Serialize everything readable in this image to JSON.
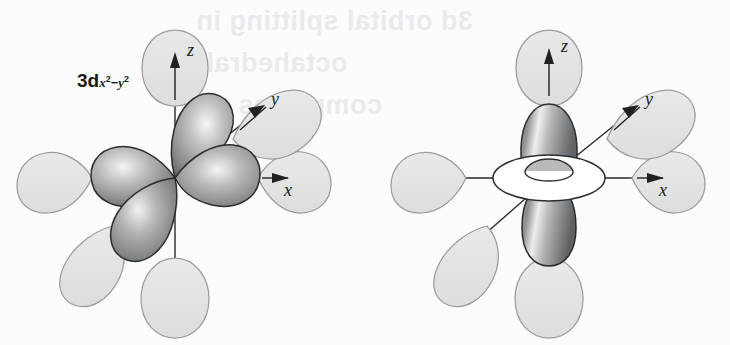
{
  "figure": {
    "kind": "orbital-diagram",
    "background_color": "#fcfcfc",
    "ink_color": "#1b1b1b",
    "ligand_lobe_fill": "#e3e4e3",
    "ligand_lobe_stroke": "#9a9c9a",
    "orbital_lobe_fill_light": "#f0f0f0",
    "orbital_lobe_fill_mid": "#8d8f8e",
    "orbital_lobe_fill_dark": "#55585a",
    "orbital_lobe_stroke": "#2b2d2e",
    "torus_fill": "#ffffff",
    "torus_stroke": "#2b2d2e"
  },
  "panels": [
    {
      "id": "dx2y2",
      "label": {
        "base": "3d",
        "sub_x": "x",
        "sub_x_exp": "2",
        "sub_minus": "−",
        "sub_y": "y",
        "sub_y_exp": "2",
        "full_text": "3d x2-y2"
      },
      "orbital_type": "d(x²−y²)",
      "orbital_lobe_count": 4,
      "orbital_lobe_directions": [
        "+x",
        "−x",
        "+y",
        "−y"
      ],
      "has_torus": false,
      "axes": [
        {
          "name": "z",
          "letter": "z",
          "direction": "up"
        },
        {
          "name": "x",
          "letter": "x",
          "direction": "right"
        },
        {
          "name": "y",
          "letter": "y",
          "direction": "up-right"
        }
      ],
      "ligand_lobes": [
        {
          "name": "ligand-plus-z",
          "position": "+z"
        },
        {
          "name": "ligand-minus-z",
          "position": "−z"
        },
        {
          "name": "ligand-plus-x",
          "position": "+x"
        },
        {
          "name": "ligand-minus-x",
          "position": "−x"
        },
        {
          "name": "ligand-plus-y",
          "position": "+y"
        },
        {
          "name": "ligand-minus-y",
          "position": "−y"
        }
      ]
    },
    {
      "id": "dz2",
      "label": {
        "base": "3d",
        "sub_z": "z",
        "sub_z_exp": "2",
        "full_text": "3d z2"
      },
      "orbital_type": "d(z²)",
      "orbital_lobe_count": 2,
      "orbital_lobe_directions": [
        "+z",
        "−z"
      ],
      "has_torus": true,
      "axes": [
        {
          "name": "z",
          "letter": "z",
          "direction": "up"
        },
        {
          "name": "x",
          "letter": "x",
          "direction": "right"
        },
        {
          "name": "y",
          "letter": "y",
          "direction": "up-right"
        }
      ],
      "ligand_lobes": [
        {
          "name": "ligand-plus-z",
          "position": "+z"
        },
        {
          "name": "ligand-minus-z",
          "position": "−z"
        },
        {
          "name": "ligand-plus-x",
          "position": "+x"
        },
        {
          "name": "ligand-minus-x",
          "position": "−x"
        },
        {
          "name": "ligand-plus-y",
          "position": "+y"
        },
        {
          "name": "ligand-minus-y",
          "position": "−y"
        }
      ]
    }
  ],
  "ghost_text": {
    "line1": "3d orbital splitting in",
    "line2": "octahedral",
    "line3": "complexes"
  }
}
